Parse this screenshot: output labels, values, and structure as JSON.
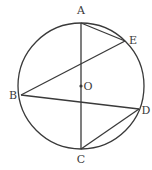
{
  "diagram": {
    "type": "circle-geometry",
    "circle": {
      "center_label": "O",
      "cx": 81,
      "cy": 86,
      "r": 63
    },
    "points": {
      "A": {
        "label": "A",
        "x": 81,
        "y": 23,
        "lx": 81,
        "ly": 14
      },
      "E": {
        "label": "E",
        "x": 125,
        "y": 41,
        "lx": 133,
        "ly": 44
      },
      "B": {
        "label": "B",
        "x": 21,
        "y": 95,
        "lx": 13,
        "ly": 99
      },
      "D": {
        "label": "D",
        "x": 139,
        "y": 109,
        "lx": 146,
        "ly": 114
      },
      "C": {
        "label": "C",
        "x": 81,
        "y": 149,
        "lx": 81,
        "ly": 163
      },
      "O": {
        "label": "O",
        "x": 81,
        "y": 86,
        "lx": 88,
        "ly": 90
      }
    },
    "segments": [
      {
        "from": "A",
        "to": "C"
      },
      {
        "from": "A",
        "to": "E"
      },
      {
        "from": "B",
        "to": "E"
      },
      {
        "from": "B",
        "to": "D"
      },
      {
        "from": "C",
        "to": "D"
      }
    ],
    "stroke_color": "#3a3a3a"
  }
}
